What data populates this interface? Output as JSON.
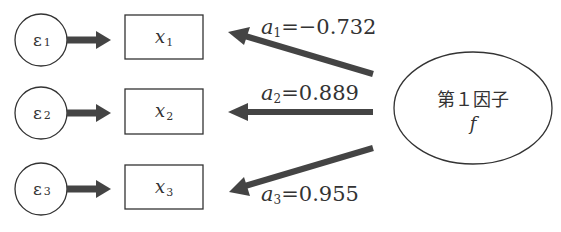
{
  "diagram": {
    "errors": [
      {
        "symbol": "ε",
        "sub": "1"
      },
      {
        "symbol": "ε",
        "sub": "2"
      },
      {
        "symbol": "ε",
        "sub": "3"
      }
    ],
    "variables": [
      {
        "symbol": "x",
        "sub": "1"
      },
      {
        "symbol": "x",
        "sub": "2"
      },
      {
        "symbol": "x",
        "sub": "3"
      }
    ],
    "loadings": [
      {
        "symbol": "a",
        "sub": "1",
        "eq": "=−0.732"
      },
      {
        "symbol": "a",
        "sub": "2",
        "eq": "=0.889"
      },
      {
        "symbol": "a",
        "sub": "3",
        "eq": "=0.955"
      }
    ],
    "factor": {
      "label": "第１因子",
      "symbol": "f"
    },
    "colors": {
      "arrow": "#444444",
      "stroke": "#333333"
    }
  }
}
